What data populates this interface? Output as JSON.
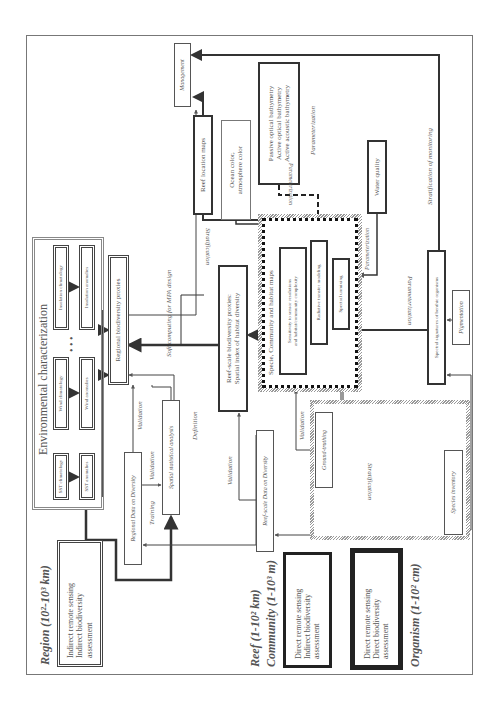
{
  "scales": {
    "region": "Region (10²-10³ km)",
    "reef": "Reef (1-10² km)",
    "community": "Community (1-10³ m)",
    "organism": "Organism (1-10² cm)"
  },
  "legend_boxes": {
    "indirect_indirect": [
      "Indirect remote sensing",
      "Indirect biodiversity",
      "assessment"
    ],
    "direct_indirect": [
      "Direct remote sensing",
      "Indirect biodiversity",
      "assessment"
    ],
    "direct_direct": [
      "Direct remote sensing",
      "Direct biodiversity",
      "assessment"
    ]
  },
  "environmental": {
    "title": "Environmental characterization",
    "sst_climatology": "SST climatology",
    "sst_anomalies": "SST anomalies",
    "wind_climatology": "Wind climatology",
    "wind_anomalies": "Wind anomalies",
    "ellipsis": "• • •",
    "insolation_climatology": "Insolation climatology",
    "insolation_anomalies": "Insolation anomalies"
  },
  "nodes": {
    "regional_proxies": "Regional biodiversity proxies",
    "regional_data": "Regional Data on Diversity",
    "spatial_analysis": "Spatial statistical analysis",
    "reef_proxies": [
      "Reef-scale biodiversity proxies:",
      "Spatial index of habitat diversity"
    ],
    "reef_data": "Reef-scale Data on Diversity",
    "habitat_maps": "Specie, Community and habitat maps",
    "sensitivity": [
      "Sensitivity to sensor resolutions",
      "and habitat/community complexity"
    ],
    "radiative": "Radiative transfer modeling",
    "unmixing": "Spectral unmixing",
    "ground_truthing": "Ground-truthing",
    "species_inventory": "Species inventory",
    "spectral_signatures": "Spectral signatures of benthic organisms",
    "pigmentation": "Pigmentation",
    "water_quality": "Water quality",
    "bathymetry": [
      "Passive optical bathymetry",
      "Active optical bathymetry",
      "Active acoustic bathymetry"
    ],
    "ocean_color": [
      "Ocean color,",
      "atmosphere color"
    ],
    "reef_location": "Reef location maps",
    "management": "Management"
  },
  "edge_labels": {
    "validation_1": "Validation",
    "validation_2": "Validation",
    "validation_3": "Validation",
    "validation_4": "Validation",
    "training": "Training",
    "definition": "Definition",
    "soft_computing": "Soft computing for MPA design",
    "stratification_1": "Stratification",
    "stratification_2": "Stratification",
    "stratification_monitoring": "Stratification of monitoring",
    "parameterization_1": "Parameterization",
    "parameterization_2": "Parameterization",
    "parameterization_3": "Parameterization",
    "parameterization_4": "Parameterization"
  }
}
